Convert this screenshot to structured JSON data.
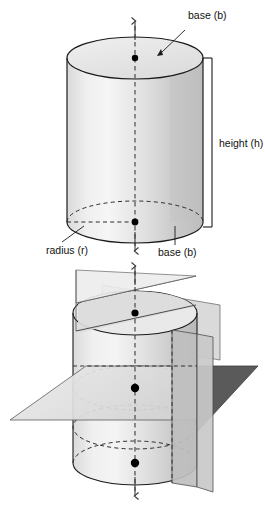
{
  "figure": {
    "background_color": "#ffffff",
    "width": 265,
    "height": 507
  },
  "palette": {
    "outline": "#1b1b1b",
    "dashed": "#2b2b2b",
    "cylinder_light": "#f2f2f2",
    "cylinder_mid": "#dcdcdc",
    "cylinder_dark": "#c2c2c2",
    "top_face": "#e8e8e8",
    "plane_light": "#e2e2e2",
    "plane_mid": "#cfcfcf",
    "plane_dark": "#565656",
    "point": "#000000",
    "text": "#111111"
  },
  "labels": {
    "base_top": "base (b)",
    "base_bottom": "base (b)",
    "height": "height (h)",
    "radius": "radius (r)"
  },
  "panels": [
    {
      "name": "upper-cylinder-panel",
      "description": "Right circular cylinder with labeled top base, bottom base, height bracket and radius.",
      "cylinder": {
        "center_x": 135,
        "top_center_y": 58,
        "bottom_center_y": 222,
        "radius_x": 68,
        "radius_y": 21
      },
      "center_points": [
        {
          "name": "top-base-center",
          "x": 135,
          "y": 58
        },
        {
          "name": "bottom-base-center",
          "x": 135,
          "y": 222
        }
      ],
      "axis": {
        "name": "vertical-axis-of-symmetry",
        "x": 135,
        "top_arrow_y": 20,
        "bottom_arrow_y": 252,
        "style": "dashed-with-arrowheads"
      },
      "height_bracket": {
        "x": 212,
        "top_y": 58,
        "bottom_y": 227,
        "tick_length": 9
      }
    },
    {
      "name": "lower-cylinder-panel",
      "description": "Same cylinder cut by a horizontal plane of symmetry and a vertical plane of symmetry; three center points marked along the axis.",
      "cylinder": {
        "center_x": 135,
        "top_center_y": 313,
        "bottom_center_y": 463,
        "radius_x": 62,
        "radius_y": 22,
        "mid_center_y": 388
      },
      "center_points": [
        {
          "name": "top-base-center",
          "x": 135,
          "y": 313
        },
        {
          "name": "mid-cross-section-center",
          "x": 135,
          "y": 388
        },
        {
          "name": "bottom-base-center",
          "x": 135,
          "y": 463
        }
      ],
      "axis": {
        "name": "vertical-axis-of-symmetry",
        "x": 135,
        "top_arrow_y": 265,
        "bottom_arrow_y": 497,
        "style": "dashed-with-arrowheads"
      },
      "planes": [
        {
          "name": "slanted-plane-band",
          "shade": "#e2e2e2"
        },
        {
          "name": "horizontal-plane-of-symmetry",
          "shade": "#dddddd"
        },
        {
          "name": "vertical-plane-of-symmetry",
          "shade": "#bdbdbd"
        },
        {
          "name": "vertical-plane-wing-shadow",
          "shade": "#565656"
        }
      ]
    }
  ]
}
